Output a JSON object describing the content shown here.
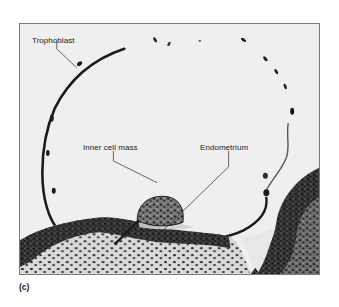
{
  "figure": {
    "panel_label": "(c)",
    "image_description": "Micrograph of blastocyst implanting into endometrium",
    "labels": {
      "trophoblast": "Trophoblast",
      "inner_cell_mass": "Inner cell mass",
      "endometrium": "Endometrium"
    },
    "colors": {
      "background": "#efefef",
      "frame_border": "#7a7a7a",
      "tissue_dark": "#1c1c1c",
      "text": "#222222"
    }
  }
}
